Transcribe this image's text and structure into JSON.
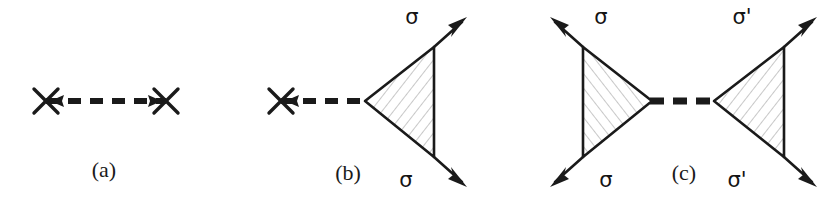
{
  "figure": {
    "kind": "feynman-diagram-set",
    "background_color": "#ffffff",
    "stroke_color": "#1a1a1a",
    "hatch_color": "#9a9a9a",
    "panel_count": 3
  },
  "panels": [
    {
      "id": "a",
      "caption": "(a)",
      "caption_x": 104,
      "caption_y": 177,
      "description": "dashed propagator terminated by a cross at each end",
      "has_triangle": false,
      "propagator": {
        "type": "dashed",
        "x1": 46,
        "x2": 166,
        "y": 101,
        "dash_pattern": "13 9",
        "width": 6
      },
      "crosses": [
        {
          "name": "cross-left",
          "cx": 46,
          "cy": 101,
          "arm": 12
        },
        {
          "name": "cross-right",
          "cx": 166,
          "cy": 101,
          "arm": 12
        }
      ],
      "propagator_arrows": [
        {
          "name": "arrow-left",
          "x": 57,
          "y": 101,
          "direction": "left"
        },
        {
          "name": "arrow-right",
          "x": 155,
          "y": 101,
          "direction": "right"
        }
      ],
      "spin_labels": []
    },
    {
      "id": "b",
      "caption": "(b)",
      "caption_x": 348,
      "caption_y": 180,
      "description": "dashed propagator with a cross at the left end feeding a hatched triangle vertex with two outgoing sigma legs",
      "has_triangle": true,
      "propagator": {
        "type": "dashed",
        "x1": 281,
        "x2": 365,
        "y": 101,
        "dash_pattern": "13 9",
        "width": 6
      },
      "crosses": [
        {
          "name": "cross-left",
          "cx": 281,
          "cy": 101,
          "arm": 12
        }
      ],
      "propagator_arrows": [
        {
          "name": "arrow-left",
          "x": 292,
          "y": 101,
          "direction": "left"
        }
      ],
      "triangle": {
        "name": "hatched-triangle-b",
        "apex": {
          "x": 365,
          "y": 101
        },
        "top": {
          "x": 434,
          "y": 47
        },
        "bottom": {
          "x": 434,
          "y": 157
        },
        "orientation": "apex-left"
      },
      "legs": [
        {
          "name": "leg-sigma-upper",
          "from": {
            "x": 434,
            "y": 47
          },
          "to": {
            "x": 462,
            "y": 22
          },
          "arrow": "outgoing"
        },
        {
          "name": "leg-sigma-lower",
          "from": {
            "x": 434,
            "y": 157
          },
          "to": {
            "x": 462,
            "y": 182
          },
          "arrow": "outgoing"
        }
      ],
      "spin_labels": [
        {
          "name": "sigma-upper",
          "text": "σ",
          "x": 412,
          "y": 24
        },
        {
          "name": "sigma-lower",
          "text": "σ",
          "x": 406,
          "y": 187
        }
      ]
    },
    {
      "id": "c",
      "caption": "(c)",
      "caption_x": 684,
      "caption_y": 180,
      "description": "two mirrored hatched triangle vertices joined by a dashed propagator; left legs labelled sigma, right legs labelled sigma prime",
      "has_triangle": true,
      "propagator": {
        "type": "dashed",
        "x1": 652,
        "x2": 714,
        "y": 101,
        "dash_pattern": "14 9",
        "width": 7
      },
      "crosses": [],
      "propagator_arrows": [],
      "triangle_left": {
        "name": "hatched-triangle-c-left",
        "apex": {
          "x": 652,
          "y": 101
        },
        "top": {
          "x": 583,
          "y": 47
        },
        "bottom": {
          "x": 583,
          "y": 157
        },
        "orientation": "apex-right"
      },
      "triangle_right": {
        "name": "hatched-triangle-c-right",
        "apex": {
          "x": 714,
          "y": 101
        },
        "top": {
          "x": 784,
          "y": 47
        },
        "bottom": {
          "x": 784,
          "y": 157
        },
        "orientation": "apex-left"
      },
      "legs": [
        {
          "name": "leg-sigma-upper-left",
          "from": {
            "x": 583,
            "y": 47
          },
          "to": {
            "x": 555,
            "y": 22
          },
          "arrow": "outgoing"
        },
        {
          "name": "leg-sigma-lower-left",
          "from": {
            "x": 583,
            "y": 157
          },
          "to": {
            "x": 555,
            "y": 182
          },
          "arrow": "outgoing"
        },
        {
          "name": "leg-sigmaprime-upper-right",
          "from": {
            "x": 784,
            "y": 47
          },
          "to": {
            "x": 812,
            "y": 22
          },
          "arrow": "outgoing"
        },
        {
          "name": "leg-sigmaprime-lower-right",
          "from": {
            "x": 784,
            "y": 157
          },
          "to": {
            "x": 812,
            "y": 182
          },
          "arrow": "outgoing"
        }
      ],
      "spin_labels": [
        {
          "name": "sigma-upper-left",
          "text": "σ",
          "x": 601,
          "y": 24
        },
        {
          "name": "sigma-lower-left",
          "text": "σ",
          "x": 606,
          "y": 187
        },
        {
          "name": "sigmaprime-upper-right",
          "text": "σ'",
          "x": 742,
          "y": 24
        },
        {
          "name": "sigmaprime-lower-right",
          "text": "σ'",
          "x": 737,
          "y": 187
        }
      ]
    }
  ],
  "captions": {
    "a": "(a)",
    "b": "(b)",
    "c": "(c)"
  },
  "labels": {
    "sigma": "σ",
    "sigma_prime": "σ'"
  }
}
